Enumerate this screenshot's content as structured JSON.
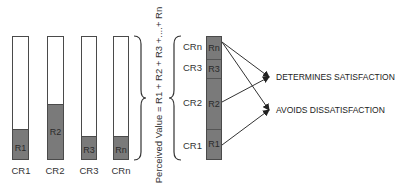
{
  "diagram": {
    "bars": [
      {
        "id": "CR1",
        "label": "CR1",
        "fill_label": "R1",
        "fill_pct": 23
      },
      {
        "id": "CR2",
        "label": "CR2",
        "fill_label": "R2",
        "fill_pct": 44
      },
      {
        "id": "CR3",
        "label": "CR3",
        "fill_label": "R3",
        "fill_pct": 18
      },
      {
        "id": "CRn",
        "label": "CRn",
        "fill_label": "Rn",
        "fill_pct": 18
      }
    ],
    "equation": "Perceived Value = R1 + R2 + R3 +....+ Rn",
    "stack": [
      {
        "label": "CRn",
        "segment": "Rn"
      },
      {
        "label": "CR3",
        "segment": "R3"
      },
      {
        "label": "CR2",
        "segment": "R2"
      },
      {
        "label": "CR1",
        "segment": "R1"
      }
    ],
    "outcomes": {
      "satisfaction": "DETERMINES SATISFACTION",
      "dissatisfaction": "AVOIDS DISSATISFACTION"
    },
    "arrows": [
      {
        "from": "Rn",
        "to": "DETERMINES SATISFACTION"
      },
      {
        "from": "Rn",
        "to": "AVOIDS DISSATISFACTION"
      },
      {
        "from": "R2",
        "to": "DETERMINES SATISFACTION"
      },
      {
        "from": "R1",
        "to": "AVOIDS DISSATISFACTION"
      }
    ],
    "colors": {
      "bar_fill": "#7a7a7a",
      "bar_border": "#4a4a4a",
      "text": "#333333"
    }
  }
}
